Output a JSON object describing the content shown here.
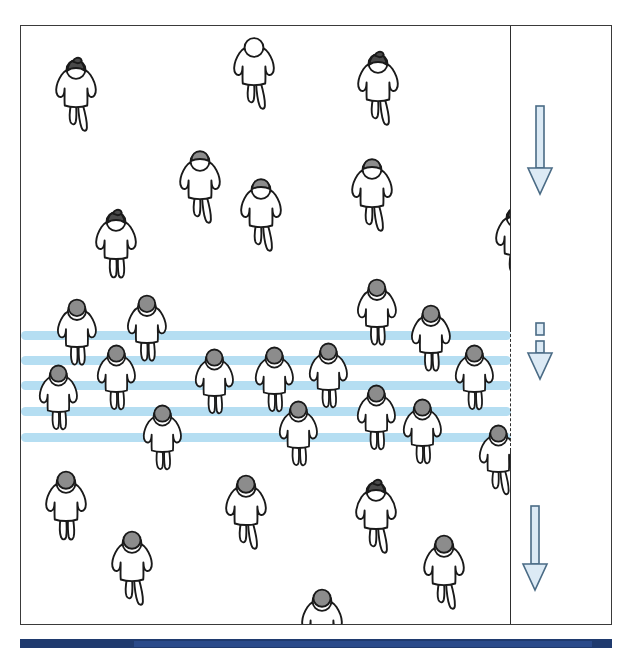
{
  "figure": {
    "domain_kind": "diagram",
    "canvas": {
      "width": 634,
      "height": 651
    },
    "frame": {
      "name": "diagram-frame",
      "x": 20,
      "y": 25,
      "width": 592,
      "height": 600,
      "border_color": "#3a3a3a",
      "fill": "#ffffff"
    },
    "colors": {
      "stripe_blue": "#a8d8f0",
      "arrow_fill": "#dceaf5",
      "arrow_stroke": "#4a6b85",
      "figure_outline": "#1a1a1a",
      "figure_body": "#ffffff",
      "head_gray": "#8c8c8c",
      "head_dark": "#4a4a4a",
      "accent_bar": "#1f3a6e",
      "accent_bar_inner": "#2a4a8a",
      "divider": "#2e2e2e"
    },
    "lane_divider": {
      "x": 489,
      "segments": [
        {
          "name": "solid-top",
          "y": 0,
          "height": 303,
          "style": "solid"
        },
        {
          "name": "dashed-middle",
          "y": 303,
          "height": 122,
          "style": "dashed"
        },
        {
          "name": "solid-bottom",
          "y": 425,
          "height": 175,
          "style": "solid"
        }
      ]
    },
    "congestion_stripes": {
      "count": 5,
      "left": 0,
      "width": 490,
      "height": 9,
      "y_positions": [
        305,
        330,
        355,
        381,
        407
      ]
    },
    "flow_arrows": [
      {
        "name": "flow-arrow-upper",
        "x": 524,
        "y": 105,
        "shaft_length": 62,
        "state": "free-flow",
        "broken": false
      },
      {
        "name": "flow-arrow-middle",
        "x": 524,
        "y": 322,
        "shaft_length": 30,
        "state": "congested",
        "broken": true
      },
      {
        "name": "flow-arrow-lower",
        "x": 519,
        "y": 505,
        "shaft_length": 58,
        "state": "free-flow",
        "broken": false
      }
    ],
    "pedestrians": [
      {
        "x": 28,
        "y": 30,
        "s": 1.0,
        "head": "bun",
        "head_tone": "dark",
        "gait": "stride"
      },
      {
        "x": 206,
        "y": 8,
        "s": 1.0,
        "head": "none",
        "head_tone": "dark",
        "gait": "stride"
      },
      {
        "x": 330,
        "y": 24,
        "s": 1.0,
        "head": "bun",
        "head_tone": "dark",
        "gait": "stride"
      },
      {
        "x": 152,
        "y": 122,
        "s": 1.0,
        "head": "flat",
        "head_tone": "gray",
        "gait": "stride"
      },
      {
        "x": 213,
        "y": 150,
        "s": 1.0,
        "head": "flat",
        "head_tone": "gray",
        "gait": "stride"
      },
      {
        "x": 324,
        "y": 130,
        "s": 1.0,
        "head": "flat",
        "head_tone": "gray",
        "gait": "stride"
      },
      {
        "x": 68,
        "y": 182,
        "s": 1.0,
        "head": "bun",
        "head_tone": "dark",
        "gait": "stand"
      },
      {
        "x": 468,
        "y": 178,
        "s": 1.0,
        "head": "bun",
        "head_tone": "dark",
        "gait": "stride"
      },
      {
        "x": 30,
        "y": 272,
        "s": 0.96,
        "head": "ball",
        "head_tone": "gray",
        "gait": "stand"
      },
      {
        "x": 100,
        "y": 268,
        "s": 0.96,
        "head": "ball",
        "head_tone": "gray",
        "gait": "stand"
      },
      {
        "x": 330,
        "y": 252,
        "s": 0.96,
        "head": "ball",
        "head_tone": "gray",
        "gait": "stand"
      },
      {
        "x": 384,
        "y": 278,
        "s": 0.96,
        "head": "ball",
        "head_tone": "gray",
        "gait": "stand"
      },
      {
        "x": 12,
        "y": 338,
        "s": 0.94,
        "head": "ball",
        "head_tone": "gray",
        "gait": "stand"
      },
      {
        "x": 70,
        "y": 318,
        "s": 0.94,
        "head": "ball",
        "head_tone": "gray",
        "gait": "stand"
      },
      {
        "x": 168,
        "y": 322,
        "s": 0.94,
        "head": "ball",
        "head_tone": "gray",
        "gait": "stand"
      },
      {
        "x": 228,
        "y": 320,
        "s": 0.94,
        "head": "ball",
        "head_tone": "gray",
        "gait": "stand"
      },
      {
        "x": 282,
        "y": 316,
        "s": 0.94,
        "head": "ball",
        "head_tone": "gray",
        "gait": "stand"
      },
      {
        "x": 330,
        "y": 358,
        "s": 0.94,
        "head": "ball",
        "head_tone": "gray",
        "gait": "stand"
      },
      {
        "x": 428,
        "y": 318,
        "s": 0.94,
        "head": "ball",
        "head_tone": "gray",
        "gait": "stand"
      },
      {
        "x": 116,
        "y": 378,
        "s": 0.94,
        "head": "ball",
        "head_tone": "gray",
        "gait": "stand"
      },
      {
        "x": 252,
        "y": 374,
        "s": 0.94,
        "head": "ball",
        "head_tone": "gray",
        "gait": "stand"
      },
      {
        "x": 376,
        "y": 372,
        "s": 0.94,
        "head": "ball",
        "head_tone": "gray",
        "gait": "stand"
      },
      {
        "x": 452,
        "y": 398,
        "s": 0.94,
        "head": "ball",
        "head_tone": "gray",
        "gait": "stride"
      },
      {
        "x": 18,
        "y": 444,
        "s": 1.0,
        "head": "ball",
        "head_tone": "gray",
        "gait": "stand"
      },
      {
        "x": 198,
        "y": 448,
        "s": 1.0,
        "head": "ball",
        "head_tone": "gray",
        "gait": "stride"
      },
      {
        "x": 328,
        "y": 452,
        "s": 1.0,
        "head": "bun",
        "head_tone": "dark",
        "gait": "stride"
      },
      {
        "x": 84,
        "y": 504,
        "s": 1.0,
        "head": "ball",
        "head_tone": "gray",
        "gait": "stride"
      },
      {
        "x": 396,
        "y": 508,
        "s": 1.0,
        "head": "ball",
        "head_tone": "gray",
        "gait": "stride"
      },
      {
        "x": 274,
        "y": 562,
        "s": 1.0,
        "head": "ball",
        "head_tone": "gray",
        "gait": "stride"
      },
      {
        "x": 150,
        "y": 618,
        "s": 1.0,
        "head": "ball",
        "head_tone": "gray",
        "gait": "stride"
      }
    ],
    "accent_bar": {
      "name": "bottom-accent-bar",
      "x": 20,
      "y": 639,
      "width": 592,
      "height": 9
    }
  }
}
